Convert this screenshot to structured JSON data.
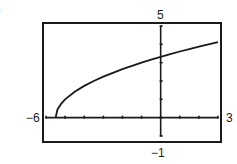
{
  "part_label": ")",
  "chart_data": {
    "type": "line",
    "title": "",
    "xlabel": "",
    "ylabel": "",
    "xlim": [
      -6,
      3
    ],
    "ylim": [
      -1,
      5
    ],
    "grid": false,
    "tick_labels": {
      "xmin": "−6",
      "xmax": "3",
      "ymax": "5",
      "ymin": "−1"
    },
    "x_ticks": [
      -6,
      -5,
      -4,
      -3,
      -2,
      -1,
      0,
      1,
      2,
      3
    ],
    "y_ticks": [
      -1,
      0,
      1,
      2,
      3,
      4,
      5
    ],
    "series": [
      {
        "name": "y = sqrt(2x + 11)",
        "x": [
          -5.5,
          -5.4,
          -5.2,
          -5,
          -4.5,
          -4,
          -3.5,
          -3,
          -2.5,
          -2,
          -1.5,
          -1,
          -0.5,
          0,
          0.5,
          1,
          1.5,
          2,
          2.5,
          3
        ],
        "values": [
          0,
          0.45,
          0.77,
          1.0,
          1.41,
          1.73,
          2.0,
          2.24,
          2.45,
          2.65,
          2.83,
          3.0,
          3.16,
          3.32,
          3.46,
          3.61,
          3.74,
          3.87,
          4.0,
          4.12
        ]
      }
    ]
  },
  "colors": {
    "ink": "#1a1a1a",
    "background": "#ffffff"
  }
}
